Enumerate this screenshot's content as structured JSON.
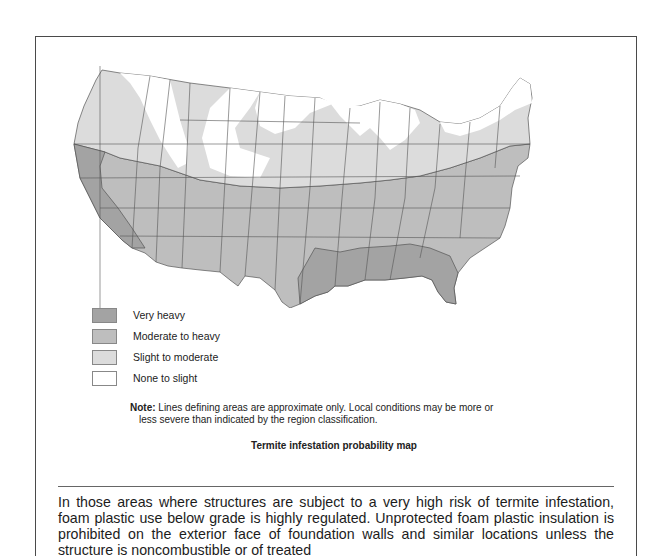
{
  "figure": {
    "title": "Termite infestation probability map",
    "legend": [
      {
        "label": "Very heavy",
        "color": "#a3a3a3"
      },
      {
        "label": "Moderate to heavy",
        "color": "#bebebe"
      },
      {
        "label": "Slight to moderate",
        "color": "#dcdcdc"
      },
      {
        "label": "None to slight",
        "color": "#ffffff"
      }
    ],
    "note_label": "Note:",
    "note_line1": " Lines defining areas are approximate only. Local conditions may be more or",
    "note_line2": "less severe than indicated by the region classification."
  },
  "body": {
    "paragraph": "In those areas where structures are subject to a very high risk of termite infestation, foam plastic use below grade is highly regulated. Unprotected foam plastic insulation is prohibited on the exterior face of foundation walls and similar locations unless the structure is noncombustible or of treated"
  }
}
